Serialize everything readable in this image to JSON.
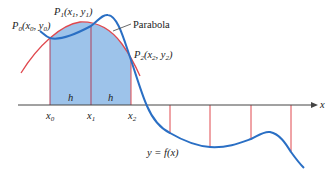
{
  "diagram": {
    "colors": {
      "function_curve": "#2a6fc4",
      "parabola": "#e0484e",
      "fill": "#9dc3ea",
      "ordinates": "#e0484e",
      "axis": "#333333"
    },
    "labels": {
      "p0": "P",
      "p0_sub": "0",
      "p0_coords": "(x",
      "p0_coords_sub": "0",
      "p0_mid": ", y",
      "p0_end_sub": "0",
      "p0_close": ")",
      "p1": "P",
      "p1_sub": "1",
      "p1_coords": "(x",
      "p1_coords_sub": "1",
      "p1_mid": ", y",
      "p1_end_sub": "1",
      "p1_close": ")",
      "p2": "P",
      "p2_sub": "2",
      "p2_coords": "(x",
      "p2_coords_sub": "2",
      "p2_mid": ", y",
      "p2_end_sub": "2",
      "p2_close": ")",
      "parabola": "Parabola",
      "h_left": "h",
      "h_right": "h",
      "x0": "x",
      "x0_sub": "0",
      "x1": "x",
      "x1_sub": "1",
      "x2": "x",
      "x2_sub": "2",
      "x_axis": "x",
      "function": "y = f(x)"
    }
  }
}
